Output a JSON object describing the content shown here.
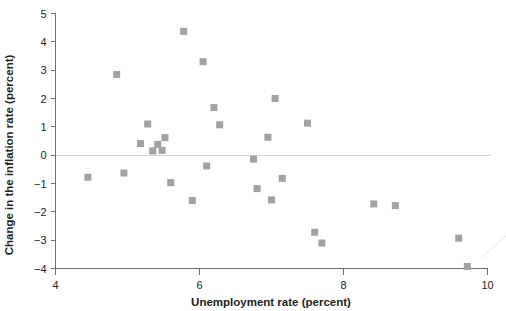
{
  "chart_data": {
    "type": "scatter",
    "title": "",
    "xlabel": "Unemployment rate (percent)",
    "ylabel": "Change in the inflation rate (percent)",
    "xlim": [
      4,
      10
    ],
    "ylim": [
      -4,
      5
    ],
    "xticks": [
      4,
      6,
      8,
      10
    ],
    "xtick_labels": [
      "4",
      "6",
      "8",
      "10"
    ],
    "yticks": [
      -4,
      -3,
      -2,
      -1,
      0,
      1,
      2,
      3,
      4,
      5
    ],
    "ytick_labels": [
      "−4",
      "−3",
      "−2",
      "−1",
      "0",
      "1",
      "2",
      "3",
      "4",
      "5"
    ],
    "grid": false,
    "legend": null,
    "reference_lines": [
      {
        "name": "zero-line",
        "axis": "y",
        "value": 0,
        "color": "#d4d4d4"
      }
    ],
    "marker": {
      "shape": "square",
      "size": 7,
      "color": "#a0a2a4"
    },
    "series": [
      {
        "name": "Unemployment vs change in inflation",
        "points": [
          {
            "x": 4.45,
            "y": -0.78
          },
          {
            "x": 4.85,
            "y": 2.85
          },
          {
            "x": 4.95,
            "y": -0.63
          },
          {
            "x": 5.18,
            "y": 0.41
          },
          {
            "x": 5.28,
            "y": 1.1
          },
          {
            "x": 5.35,
            "y": 0.15
          },
          {
            "x": 5.42,
            "y": 0.38
          },
          {
            "x": 5.48,
            "y": 0.17
          },
          {
            "x": 5.52,
            "y": 0.62
          },
          {
            "x": 5.6,
            "y": -0.97
          },
          {
            "x": 5.78,
            "y": 4.37
          },
          {
            "x": 5.9,
            "y": -1.6
          },
          {
            "x": 6.05,
            "y": 3.3
          },
          {
            "x": 6.1,
            "y": -0.38
          },
          {
            "x": 6.2,
            "y": 1.68
          },
          {
            "x": 6.28,
            "y": 1.07
          },
          {
            "x": 6.75,
            "y": -0.14
          },
          {
            "x": 6.8,
            "y": -1.18
          },
          {
            "x": 6.95,
            "y": 0.63
          },
          {
            "x": 7.0,
            "y": -1.58
          },
          {
            "x": 7.05,
            "y": 2.0
          },
          {
            "x": 7.15,
            "y": -0.82
          },
          {
            "x": 7.5,
            "y": 1.13
          },
          {
            "x": 7.6,
            "y": -2.72
          },
          {
            "x": 7.7,
            "y": -3.1
          },
          {
            "x": 8.42,
            "y": -1.72
          },
          {
            "x": 8.72,
            "y": -1.78
          },
          {
            "x": 9.6,
            "y": -2.93
          },
          {
            "x": 9.72,
            "y": -3.93
          }
        ]
      }
    ]
  },
  "axes": {
    "x_title": "Unemployment rate (percent)",
    "y_title": "Change in the inflation rate (percent)"
  }
}
